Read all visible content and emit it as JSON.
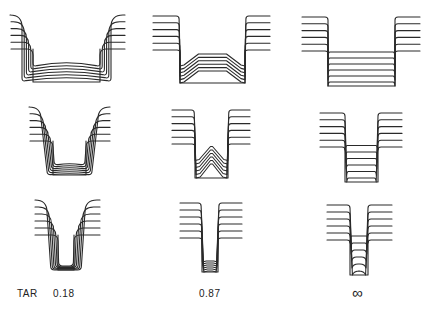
{
  "figure": {
    "rows": [
      {
        "row": "wide-trench"
      },
      {
        "row": "medium-trench"
      },
      {
        "row": "narrow-trench"
      }
    ],
    "columns": [
      {
        "tar_value": "0.18"
      },
      {
        "tar_value": "0.87"
      },
      {
        "tar_value": "∞"
      }
    ],
    "labels": {
      "axis_label": "TAR",
      "col1": "0.18",
      "col2": "0.87",
      "col3": "∞"
    },
    "colors": {
      "ink": "#2a2a2a",
      "background": "#ffffff"
    }
  }
}
